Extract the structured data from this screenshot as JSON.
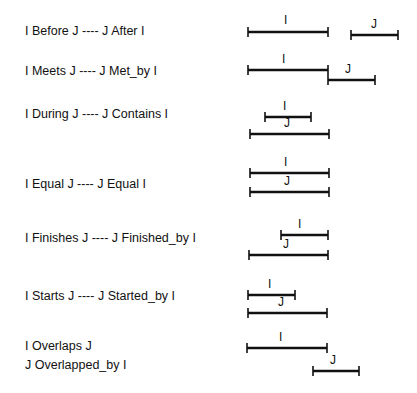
{
  "relations": [
    {
      "text": "I Before J ---- J After I",
      "y": 24,
      "bars": [
        {
          "name": "I",
          "x1": 248,
          "x2": 328,
          "y": 32,
          "lx": 284,
          "ly": 24
        },
        {
          "name": "J",
          "x1": 351,
          "x2": 398,
          "y": 35,
          "lx": 371,
          "ly": 28
        }
      ]
    },
    {
      "text": "I Meets J  ----  J Met_by I",
      "y": 64,
      "bars": [
        {
          "name": "I",
          "x1": 248,
          "x2": 328,
          "y": 70,
          "lx": 282,
          "ly": 63
        },
        {
          "name": "J",
          "x1": 328,
          "x2": 375,
          "y": 80,
          "lx": 345,
          "ly": 73
        }
      ]
    },
    {
      "text": "I During J  ----  J Contains I",
      "y": 107,
      "bars": [
        {
          "name": "I",
          "x1": 265,
          "x2": 311,
          "y": 117,
          "lx": 283,
          "ly": 110
        },
        {
          "name": "J",
          "x1": 250,
          "x2": 329,
          "y": 134,
          "lx": 284,
          "ly": 127
        }
      ]
    },
    {
      "text": "I Equal J  ----  J Equal I",
      "y": 177,
      "bars": [
        {
          "name": "I",
          "x1": 250,
          "x2": 329,
          "y": 173,
          "lx": 284,
          "ly": 166
        },
        {
          "name": "J",
          "x1": 250,
          "x2": 329,
          "y": 192,
          "lx": 284,
          "ly": 185
        }
      ]
    },
    {
      "text": "I Finishes J  ----  J Finished_by  I",
      "y": 231,
      "bars": [
        {
          "name": "I",
          "x1": 281,
          "x2": 328,
          "y": 235,
          "lx": 298,
          "ly": 228
        },
        {
          "name": "J",
          "x1": 249,
          "x2": 328,
          "y": 255,
          "lx": 283,
          "ly": 248
        }
      ]
    },
    {
      "text": "I Starts J  ----  J  Started_by I",
      "y": 289,
      "bars": [
        {
          "name": "I",
          "x1": 248,
          "x2": 295,
          "y": 295,
          "lx": 268,
          "ly": 288
        },
        {
          "name": "J",
          "x1": 248,
          "x2": 327,
          "y": 313,
          "lx": 278,
          "ly": 306
        }
      ]
    },
    {
      "text": "I Overlaps J",
      "y": 339,
      "bars": []
    },
    {
      "text": "J Overlapped_by  I",
      "y": 358,
      "bars": [
        {
          "name": "I",
          "x1": 247,
          "x2": 327,
          "y": 348,
          "lx": 279,
          "ly": 341
        },
        {
          "name": "J",
          "x1": 313,
          "x2": 359,
          "y": 371,
          "lx": 330,
          "ly": 364
        }
      ]
    }
  ]
}
